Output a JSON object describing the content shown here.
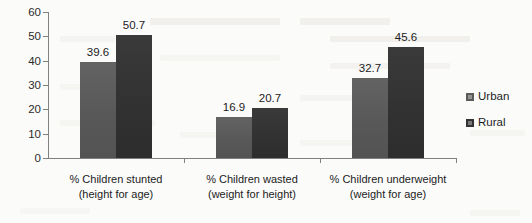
{
  "chart_data": {
    "type": "bar",
    "title": "",
    "subtitle": "",
    "xlabel": "",
    "ylabel": "",
    "ylim": [
      0,
      60
    ],
    "ytick_step": 10,
    "yticks": [
      60,
      50,
      40,
      30,
      20,
      10,
      0
    ],
    "grid": false,
    "legend_position": "right",
    "categories": [
      "% Children stunted (height for age)",
      "% Children wasted (weight for height)",
      "% Children underweight (weight for age)"
    ],
    "category_lines": [
      {
        "line1": "% Children stunted",
        "line2": "(height for age)"
      },
      {
        "line1": "% Children wasted",
        "line2": "(weight for height)"
      },
      {
        "line1": "% Children underweight",
        "line2": "(weight for age)"
      }
    ],
    "series": [
      {
        "name": "Urban",
        "color": "#5b5b5b",
        "values": [
          39.6,
          16.9,
          32.7
        ],
        "labels": [
          "39.6",
          "16.9",
          "32.7"
        ]
      },
      {
        "name": "Rural",
        "color": "#333333",
        "values": [
          50.7,
          20.7,
          45.6
        ],
        "labels": [
          "50.7",
          "20.7",
          "45.6"
        ]
      }
    ]
  },
  "legend": {
    "items": [
      {
        "label": "Urban",
        "color": "#5b5b5b"
      },
      {
        "label": "Rural",
        "color": "#333333"
      }
    ]
  },
  "axis": {
    "y_labels": [
      "60",
      "50",
      "40",
      "30",
      "20",
      "10",
      "0"
    ]
  }
}
